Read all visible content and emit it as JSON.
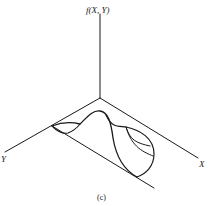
{
  "figure": {
    "caption": "(c)",
    "axes": {
      "vertical_label": "f(X, Y)",
      "x_label": "X",
      "y_label": "Y"
    }
  }
}
